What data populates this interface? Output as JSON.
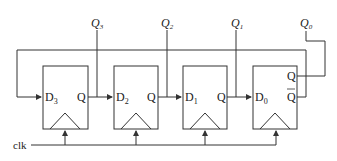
{
  "diagram": {
    "type": "twisted-ring-counter",
    "clock_label": "clk",
    "stroke_color": "#333333",
    "flip_flops": [
      {
        "id": "ff3",
        "d_label": "D",
        "d_sub": "3",
        "q_label": "Q",
        "output_label": "Q",
        "output_sub": "3"
      },
      {
        "id": "ff2",
        "d_label": "D",
        "d_sub": "2",
        "q_label": "Q",
        "output_label": "Q",
        "output_sub": "2"
      },
      {
        "id": "ff1",
        "d_label": "D",
        "d_sub": "1",
        "q_label": "Q",
        "output_label": "Q",
        "output_sub": "1"
      },
      {
        "id": "ff0",
        "d_label": "D",
        "d_sub": "0",
        "q_label": "Q",
        "qbar_label": "Q",
        "output_label": "Q",
        "output_sub": "0"
      }
    ]
  }
}
